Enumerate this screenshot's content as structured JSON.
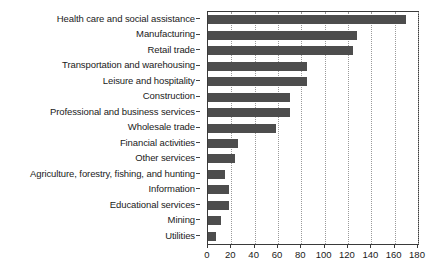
{
  "chart_data": {
    "type": "bar",
    "orientation": "horizontal",
    "title": "",
    "subtitle": "",
    "xlabel": "",
    "ylabel": "",
    "xlim": [
      0,
      180
    ],
    "xticks": [
      0,
      20,
      40,
      60,
      80,
      100,
      120,
      140,
      160,
      180
    ],
    "grid": true,
    "legend": null,
    "bar_color": "#4d4d4d",
    "categories": [
      "Health care and social assistance",
      "Manufacturing",
      "Retail trade",
      "Transportation and warehousing",
      "Leisure and hospitality",
      "Construction",
      "Professional and business services",
      "Wholesale trade",
      "Financial activities",
      "Other services",
      "Agriculture, forestry, fishing, and hunting",
      "Information",
      "Educational services",
      "Mining",
      "Utilities"
    ],
    "values": [
      170,
      128,
      124,
      85,
      85,
      70,
      70,
      58,
      26,
      23,
      15,
      18,
      18,
      11,
      7
    ]
  }
}
